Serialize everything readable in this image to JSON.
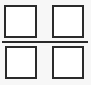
{
  "diagram": {
    "colors": {
      "stroke": "#2a2a2a",
      "fill": "#ffffff",
      "background": "#f7f7f7"
    },
    "panes": [
      {
        "id": "top-left",
        "x": 4,
        "y": 5,
        "w": 33,
        "h": 33
      },
      {
        "id": "top-right",
        "x": 52,
        "y": 5,
        "w": 32,
        "h": 33
      },
      {
        "id": "bottom-left",
        "x": 5,
        "y": 46,
        "w": 32,
        "h": 33
      },
      {
        "id": "bottom-right",
        "x": 52,
        "y": 46,
        "w": 32,
        "h": 33
      }
    ],
    "divider": {
      "x": 2,
      "y": 41,
      "w": 86,
      "h": 2
    }
  }
}
